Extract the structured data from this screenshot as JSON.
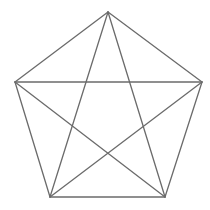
{
  "diagram": {
    "type": "pentagon-with-diagonals",
    "stroke_color": "#6b6b6b",
    "stroke_width": 1.3,
    "background": "#ffffff",
    "vertices": [
      {
        "id": "top",
        "x": 108,
        "y": 12
      },
      {
        "id": "right",
        "x": 202,
        "y": 82
      },
      {
        "id": "bottom-right",
        "x": 165,
        "y": 197
      },
      {
        "id": "bottom-left",
        "x": 50,
        "y": 197
      },
      {
        "id": "left",
        "x": 15,
        "y": 82
      }
    ],
    "edges": [
      [
        "top",
        "right"
      ],
      [
        "right",
        "bottom-right"
      ],
      [
        "bottom-right",
        "bottom-left"
      ],
      [
        "bottom-left",
        "left"
      ],
      [
        "left",
        "top"
      ]
    ],
    "diagonals": [
      [
        "top",
        "bottom-right"
      ],
      [
        "top",
        "bottom-left"
      ],
      [
        "left",
        "right"
      ],
      [
        "left",
        "bottom-right"
      ],
      [
        "right",
        "bottom-left"
      ]
    ]
  }
}
